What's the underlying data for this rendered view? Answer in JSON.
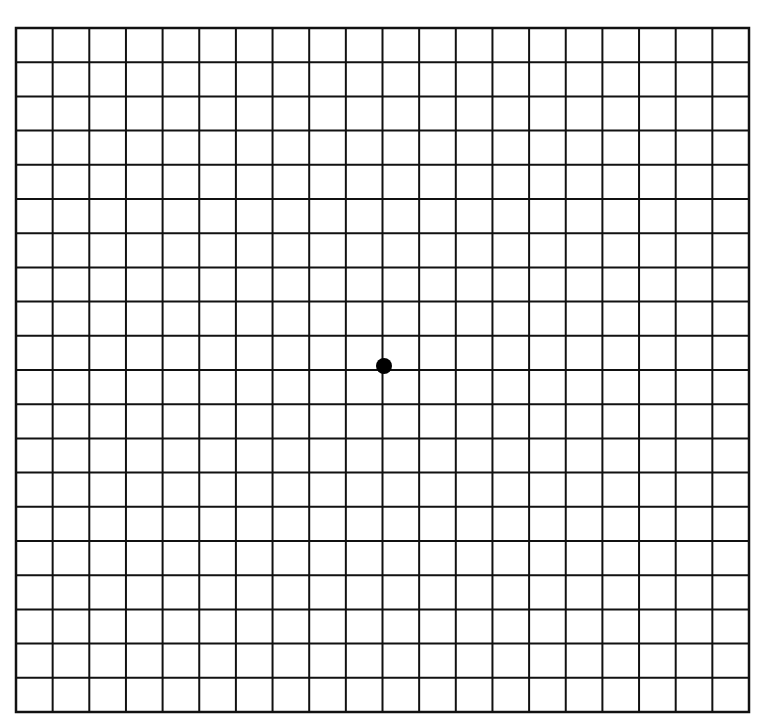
{
  "diagram": {
    "type": "amsler-grid",
    "columns": 20,
    "rows": 20,
    "grid_box": {
      "left": 16,
      "top": 28,
      "right": 749,
      "bottom": 712
    },
    "line_color": "#111111",
    "background_color": "#ffffff",
    "center_dot": {
      "x": 384,
      "y": 366,
      "radius": 8,
      "color": "#000000"
    }
  }
}
